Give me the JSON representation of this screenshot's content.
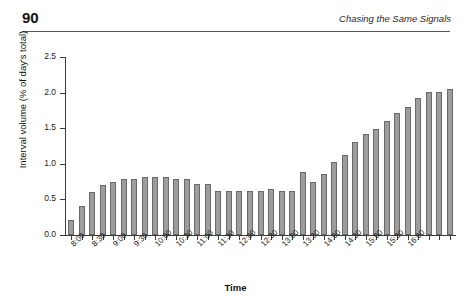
{
  "header": {
    "page_number": "90",
    "running_head": "Chasing the Same Signals"
  },
  "chart_data": {
    "type": "bar",
    "title": "",
    "xlabel": "Time",
    "ylabel": "Interval volume (% of day's total)",
    "ylim": [
      0.0,
      2.5
    ],
    "ytick_labels": [
      "0.0",
      "0.5",
      "1.0",
      "1.5",
      "2.0",
      "2.5"
    ],
    "ytick_values": [
      0.0,
      0.5,
      1.0,
      1.5,
      2.0,
      2.5
    ],
    "grid": false,
    "legend": "none",
    "bar_color": "#9d9d9d",
    "bar_edge_color": "#6a6a6a",
    "interval_minutes": 15,
    "categories": [
      "8:00",
      "8:15",
      "8:30",
      "8:45",
      "9:00",
      "9:15",
      "9:30",
      "9:45",
      "10:00",
      "10:15",
      "10:30",
      "10:45",
      "11:00",
      "11:15",
      "11:30",
      "11:45",
      "12:00",
      "12:15",
      "12:30",
      "12:45",
      "13:00",
      "13:15",
      "13:30",
      "13:45",
      "14:00",
      "14:15",
      "14:30",
      "14:45",
      "15:00",
      "15:15",
      "15:30",
      "15:45",
      "16:00",
      "16:15",
      "16:30",
      "16:45",
      "17:00"
    ],
    "labeled_ticks": [
      "8:00",
      "8:30",
      "9:00",
      "9:30",
      "10:00",
      "10:30",
      "11:00",
      "11:30",
      "12:00",
      "12:30",
      "13:00",
      "13:30",
      "14:00",
      "14:30",
      "15:00",
      "15:30",
      "16:00"
    ],
    "values": [
      0.21,
      0.41,
      0.6,
      0.7,
      0.75,
      0.78,
      0.79,
      0.81,
      0.81,
      0.81,
      0.79,
      0.78,
      0.72,
      0.72,
      0.62,
      0.62,
      0.62,
      0.62,
      0.62,
      0.65,
      0.62,
      0.62,
      0.89,
      0.74,
      0.86,
      1.02,
      1.12,
      1.31,
      1.42,
      1.49,
      1.6,
      1.72,
      1.8,
      1.93,
      2.01,
      2.01,
      2.05
    ]
  }
}
